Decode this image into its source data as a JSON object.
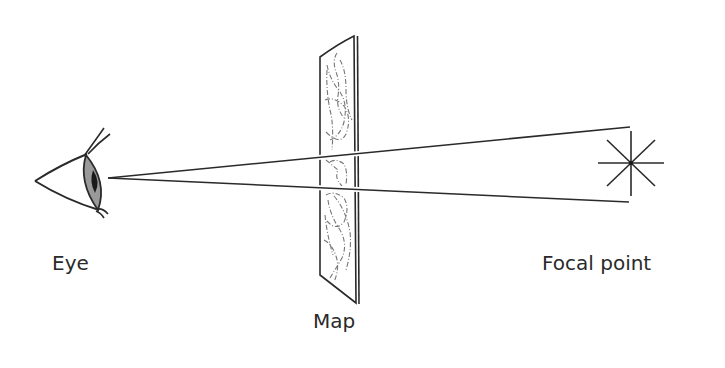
{
  "diagram": {
    "labels": {
      "eye": "Eye",
      "map": "Map",
      "focal_point": "Focal point"
    },
    "elements": [
      {
        "id": "eye",
        "icon": "eye-icon",
        "description": "Side-view eye on left"
      },
      {
        "id": "map",
        "icon": "map-panel",
        "description": "Tilted transparent map panel with dashed route lines"
      },
      {
        "id": "focal_point",
        "icon": "asterisk-star-icon",
        "description": "Eight-spoke star marking the focal point"
      },
      {
        "id": "sight_lines",
        "description": "Two converging lines from eye to focal point passing through map"
      }
    ],
    "colors": {
      "stroke": "#2a2a2a",
      "iris": "#9a9a9a",
      "pupil": "#1a1a1a",
      "map_lines": "#777777",
      "background": "#ffffff"
    }
  }
}
